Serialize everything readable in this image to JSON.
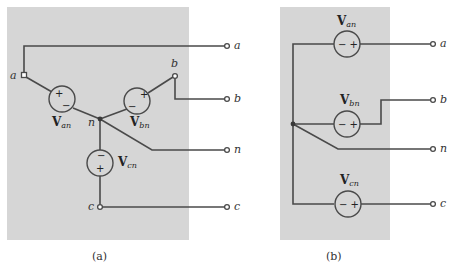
{
  "figure": {
    "panels": [
      {
        "id": "a",
        "caption": "(a)",
        "description": "Y-connected (wye) three-phase voltage sources",
        "sources": [
          {
            "name": "V",
            "sub": "an",
            "plus": "+",
            "minus": "−"
          },
          {
            "name": "V",
            "sub": "bn",
            "plus": "+",
            "minus": "−"
          },
          {
            "name": "V",
            "sub": "cn",
            "plus": "+",
            "minus": "−"
          }
        ],
        "internal_nodes": [
          "a",
          "b",
          "n",
          "c"
        ],
        "terminals": [
          "a",
          "b",
          "n",
          "c"
        ]
      },
      {
        "id": "b",
        "caption": "(b)",
        "description": "Equivalent redrawn wye sources with common neutral",
        "sources": [
          {
            "name": "V",
            "sub": "an",
            "minus_plus": "− +"
          },
          {
            "name": "V",
            "sub": "bn",
            "minus_plus": "− +"
          },
          {
            "name": "V",
            "sub": "cn",
            "minus_plus": "− +"
          }
        ],
        "terminals": [
          "a",
          "b",
          "n",
          "c"
        ]
      }
    ],
    "colors": {
      "panel_bg": "#d6d6d6",
      "wire": "#4a4a4a",
      "page_bg": "#ffffff"
    }
  }
}
